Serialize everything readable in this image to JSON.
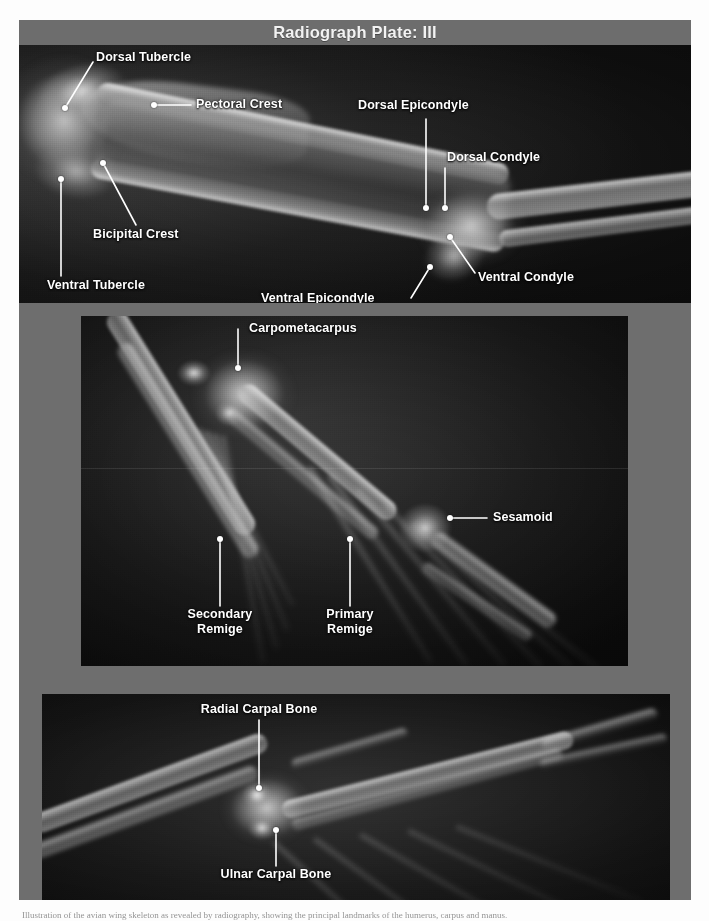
{
  "page": {
    "background_color": "#fdfdfd",
    "plate_background_color": "#6e6e6e",
    "label_color": "#ffffff"
  },
  "title_bar": {
    "title": "Radiograph Plate: III",
    "background_color": "#6d6d6d",
    "text_color": "#f2f2f2"
  },
  "panels": [
    {
      "id": "panel-1",
      "name": "humerus-radiograph",
      "caption": "",
      "labels": [
        {
          "text": "Dorsal Tubercle",
          "align": "left"
        },
        {
          "text": "Pectoral Crest",
          "align": "left"
        },
        {
          "text": "Dorsal Epicondyle",
          "align": "left"
        },
        {
          "text": "Dorsal Condyle",
          "align": "left"
        },
        {
          "text": "Bicipital Crest",
          "align": "left"
        },
        {
          "text": "Ventral Tubercle",
          "align": "left"
        },
        {
          "text": "Ventral Epicondyle",
          "align": "left"
        },
        {
          "text": "Ventral Condyle",
          "align": "left"
        }
      ]
    },
    {
      "id": "panel-2",
      "name": "carpometacarpus-radiograph",
      "caption": "",
      "labels": [
        {
          "text": "Carpometacarpus",
          "align": "left"
        },
        {
          "text": "Sesamoid",
          "align": "left"
        },
        {
          "text": "Secondary\nRemige",
          "align": "center"
        },
        {
          "text": "Primary\nRemige",
          "align": "center"
        }
      ]
    },
    {
      "id": "panel-3",
      "name": "carpal-bones-radiograph",
      "caption": "",
      "labels": [
        {
          "text": "Radial Carpal Bone",
          "align": "center"
        },
        {
          "text": "Ulnar Carpal Bone",
          "align": "center"
        }
      ]
    }
  ],
  "annotations": {
    "p1_dorsal_tubercle": {
      "label": "Dorsal Tubercle"
    },
    "p1_pectoral_crest": {
      "label": "Pectoral Crest"
    },
    "p1_dorsal_epicondyle": {
      "label": "Dorsal Epicondyle"
    },
    "p1_dorsal_condyle": {
      "label": "Dorsal Condyle"
    },
    "p1_bicipital_crest": {
      "label": "Bicipital Crest"
    },
    "p1_ventral_tubercle": {
      "label": "Ventral Tubercle"
    },
    "p1_ventral_epicondyle": {
      "label": "Ventral Epicondyle"
    },
    "p1_ventral_condyle": {
      "label": "Ventral Condyle"
    },
    "p2_carpometacarpus": {
      "label": "Carpometacarpus"
    },
    "p2_sesamoid": {
      "label": "Sesamoid"
    },
    "p2_secondary_remige_1": {
      "label": "Secondary"
    },
    "p2_secondary_remige_2": {
      "label": "Remige"
    },
    "p2_primary_remige_1": {
      "label": "Primary"
    },
    "p2_primary_remige_2": {
      "label": "Remige"
    },
    "p3_radial_carpal_bone": {
      "label": "Radial Carpal Bone"
    },
    "p3_ulnar_carpal_bone": {
      "label": "Ulnar Carpal Bone"
    }
  },
  "caption_sliver": {
    "text": "Illustration of the avian wing skeleton as revealed by radiography, showing the principal landmarks of the humerus, carpus and manus."
  }
}
